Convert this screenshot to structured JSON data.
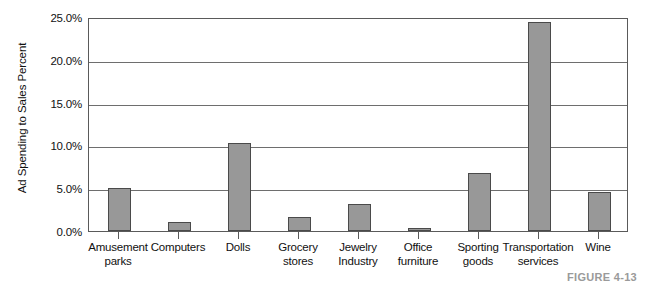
{
  "chart_data": {
    "type": "bar",
    "title": "",
    "xlabel": "",
    "ylabel": "Ad Spending to Sales Percent",
    "ylim": [
      0,
      25
    ],
    "grid": true,
    "legend": false,
    "units": "percent",
    "categories": [
      "Amusement parks",
      "Computers",
      "Dolls",
      "Grocery stores",
      "Jewelry Industry",
      "Office furniture",
      "Sporting goods",
      "Transportation services",
      "Wine"
    ],
    "category_lines": [
      [
        "Amusement",
        "parks"
      ],
      [
        "Computers",
        ""
      ],
      [
        "Dolls",
        ""
      ],
      [
        "Grocery",
        "stores"
      ],
      [
        "Jewelry",
        "Industry"
      ],
      [
        "Office",
        "furniture"
      ],
      [
        "Sporting",
        "goods"
      ],
      [
        "Transportation",
        "services"
      ],
      [
        "Wine",
        ""
      ]
    ],
    "values": [
      5.0,
      1.0,
      10.3,
      1.6,
      3.1,
      0.4,
      6.8,
      24.4,
      4.5
    ],
    "ytick_labels": [
      "0.0%",
      "5.0%",
      "10.0%",
      "15.0%",
      "20.0%",
      "25.0%"
    ],
    "ytick_values": [
      0,
      5,
      10,
      15,
      20,
      25
    ],
    "bar_color": "#989898",
    "bar_border_color": "#4a4a4a",
    "gridline_color": "#6e6e6e",
    "axis_color": "#5a5a5a"
  },
  "caption": "FIGURE 4-13"
}
